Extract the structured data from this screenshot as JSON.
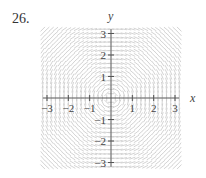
{
  "problem_number": "26.",
  "chart_data": {
    "type": "slope_field",
    "title": "",
    "differential_equation_pattern": "dy/dx = -x/y (concentric circles)",
    "xlabel": "x",
    "ylabel": "y",
    "xlim": [
      -3,
      3
    ],
    "ylim": [
      -3,
      3
    ],
    "x_ticks": [
      -3,
      -2,
      -1,
      1,
      2,
      3
    ],
    "y_ticks": [
      -3,
      -2,
      -1,
      1,
      2,
      3
    ],
    "x_tick_labels": [
      "−3",
      "−2",
      "−1",
      "1",
      "2",
      "3"
    ],
    "y_tick_labels": [
      "−3",
      "−2",
      "−1",
      "1",
      "2",
      "3"
    ],
    "grid": false,
    "grid_step": 0.2,
    "segment_color": "#c8c8c8",
    "axis_color": "#555555"
  }
}
